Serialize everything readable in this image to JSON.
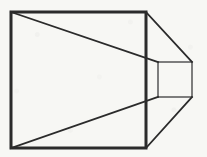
{
  "figure": {
    "background_color": "#f7f7f4",
    "stroke_color": "#2b2b2b",
    "thin_stroke_color": "#555555",
    "canvas": {
      "width": 207,
      "height": 157
    },
    "shapes": {
      "large_square": {
        "name": "large-front-square",
        "x1": 11,
        "y1": 12,
        "x2": 146,
        "y2": 148,
        "stroke_width": 3
      },
      "small_square": {
        "name": "small-rear-square",
        "x1": 158,
        "y1": 62,
        "x2": 192,
        "y2": 97,
        "stroke_width": 1.5
      }
    },
    "connector_lines": [
      {
        "name": "inner-top-diagonal",
        "x1": 11,
        "y1": 12,
        "x2": 158,
        "y2": 62,
        "stroke_width": 1.8
      },
      {
        "name": "inner-bottom-diagonal",
        "x1": 11,
        "y1": 148,
        "x2": 158,
        "y2": 97,
        "stroke_width": 1.8
      },
      {
        "name": "outer-top-diagonal",
        "x1": 146,
        "y1": 12,
        "x2": 192,
        "y2": 62,
        "stroke_width": 1.8
      },
      {
        "name": "outer-bottom-diagonal",
        "x1": 146,
        "y1": 148,
        "x2": 192,
        "y2": 97,
        "stroke_width": 1.8
      }
    ]
  }
}
